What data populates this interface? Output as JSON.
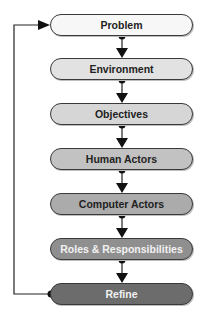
{
  "diagram": {
    "type": "flowchart",
    "steps": [
      {
        "label": "Problem",
        "fill": "#f7f7f7",
        "text_color": "#222222"
      },
      {
        "label": "Environment",
        "fill": "#e2e2e2",
        "text_color": "#222222"
      },
      {
        "label": "Objectives",
        "fill": "#d6d6d6",
        "text_color": "#222222"
      },
      {
        "label": "Human Actors",
        "fill": "#c2c2c2",
        "text_color": "#222222"
      },
      {
        "label": "Computer Actors",
        "fill": "#ababab",
        "text_color": "#222222"
      },
      {
        "label": "Roles & Responsibilities",
        "fill": "#8f8f8f",
        "text_color": "#f2f2f2"
      },
      {
        "label": "Refine",
        "fill": "#6c6c6c",
        "text_color": "#f2f2f2"
      }
    ],
    "loop": {
      "from": "Refine",
      "to": "Problem"
    }
  }
}
